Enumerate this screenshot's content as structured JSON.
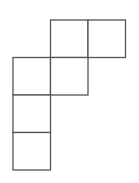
{
  "diagram": {
    "type": "cube-net",
    "cell_size": 37.5,
    "origin": {
      "x": 13,
      "y": 20
    },
    "stroke_color": "#555555",
    "stroke_width": 1.3,
    "fill_color": "#ffffff",
    "cells": [
      {
        "row": 0,
        "col": 1
      },
      {
        "row": 0,
        "col": 2
      },
      {
        "row": 1,
        "col": 0
      },
      {
        "row": 1,
        "col": 1
      },
      {
        "row": 2,
        "col": 0
      },
      {
        "row": 3,
        "col": 0
      }
    ]
  }
}
